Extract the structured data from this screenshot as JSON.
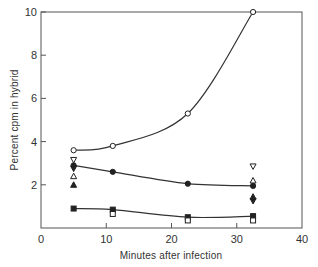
{
  "chart_data": {
    "type": "scatter",
    "title": "",
    "xlabel": "Minutes after infection",
    "ylabel": "Percent cpm in hybrid",
    "xlim": [
      0,
      40
    ],
    "ylim": [
      0,
      10
    ],
    "xticks": [
      0,
      10,
      20,
      30,
      40
    ],
    "yticks": [
      2,
      4,
      6,
      8,
      10
    ],
    "xtick_labels": [
      "0",
      "10",
      "20",
      "30",
      "40"
    ],
    "ytick_labels": [
      "2",
      "4",
      "6",
      "8",
      "10"
    ],
    "grid": false,
    "legend": "none",
    "series": [
      {
        "name": "open circles (fitted curve)",
        "marker": "open-circle",
        "line": true,
        "x": [
          5,
          11,
          22.5,
          32.5
        ],
        "y": [
          3.6,
          3.8,
          5.3,
          10.0
        ]
      },
      {
        "name": "filled circles (fitted curve)",
        "marker": "filled-circle",
        "line": true,
        "x": [
          5,
          11,
          22.5,
          32.5
        ],
        "y": [
          2.9,
          2.6,
          2.05,
          1.95
        ]
      },
      {
        "name": "filled squares (fitted curve)",
        "marker": "filled-square",
        "line": true,
        "x": [
          5,
          11,
          22.5,
          32.5
        ],
        "y": [
          0.9,
          0.85,
          0.5,
          0.55
        ]
      },
      {
        "name": "open squares",
        "marker": "open-square",
        "line": false,
        "x": [
          11,
          22.5,
          32.5
        ],
        "y": [
          0.65,
          0.35,
          0.35
        ]
      },
      {
        "name": "open inverted triangles",
        "marker": "open-triangle-down",
        "line": false,
        "x": [
          5,
          32.5
        ],
        "y": [
          3.15,
          2.85
        ]
      },
      {
        "name": "filled inverted triangles",
        "marker": "filled-triangle-down",
        "line": false,
        "x": [
          5,
          32.5
        ],
        "y": [
          2.75,
          1.25
        ]
      },
      {
        "name": "open triangles",
        "marker": "open-triangle-up",
        "line": false,
        "x": [
          5,
          32.5
        ],
        "y": [
          2.4,
          2.2
        ]
      },
      {
        "name": "filled triangles",
        "marker": "filled-triangle-up",
        "line": false,
        "x": [
          5,
          32.5
        ],
        "y": [
          2.0,
          1.45
        ]
      }
    ]
  }
}
